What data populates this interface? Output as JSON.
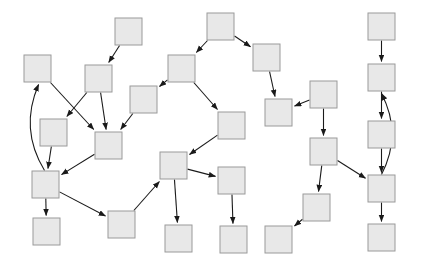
{
  "diagram": {
    "type": "directed-graph",
    "canvas": {
      "width": 424,
      "height": 265,
      "background": "#ffffff"
    },
    "style": {
      "node_fill": "#e8e8e8",
      "node_stroke": "#9a9a9a",
      "node_stroke_width": 1,
      "edge_color": "#1a1a1a",
      "edge_width": 1.1,
      "node_width": 27,
      "node_height": 27,
      "arrowhead": "filled-triangle"
    },
    "node_count": 27,
    "edge_count": 29,
    "nodes": [
      {
        "id": "n1",
        "label": "",
        "x": 24,
        "y": 55
      },
      {
        "id": "n2",
        "label": "",
        "x": 115,
        "y": 18
      },
      {
        "id": "n3",
        "label": "",
        "x": 207,
        "y": 13
      },
      {
        "id": "n4",
        "label": "",
        "x": 253,
        "y": 44
      },
      {
        "id": "n5",
        "label": "",
        "x": 368,
        "y": 13
      },
      {
        "id": "n6",
        "label": "",
        "x": 85,
        "y": 65
      },
      {
        "id": "n7",
        "label": "",
        "x": 168,
        "y": 55
      },
      {
        "id": "n8",
        "label": "",
        "x": 368,
        "y": 64
      },
      {
        "id": "n9",
        "label": "",
        "x": 130,
        "y": 86
      },
      {
        "id": "n10",
        "label": "",
        "x": 310,
        "y": 81
      },
      {
        "id": "n11",
        "label": "",
        "x": 265,
        "y": 99
      },
      {
        "id": "n12",
        "label": "",
        "x": 40,
        "y": 119
      },
      {
        "id": "n13",
        "label": "",
        "x": 95,
        "y": 132
      },
      {
        "id": "n14",
        "label": "",
        "x": 218,
        "y": 112
      },
      {
        "id": "n15",
        "label": "",
        "x": 368,
        "y": 121
      },
      {
        "id": "n16",
        "label": "",
        "x": 310,
        "y": 138
      },
      {
        "id": "n17",
        "label": "",
        "x": 160,
        "y": 152
      },
      {
        "id": "n18",
        "label": "",
        "x": 32,
        "y": 171
      },
      {
        "id": "n19",
        "label": "",
        "x": 218,
        "y": 167
      },
      {
        "id": "n20",
        "label": "",
        "x": 368,
        "y": 175
      },
      {
        "id": "n21",
        "label": "",
        "x": 303,
        "y": 194
      },
      {
        "id": "n22",
        "label": "",
        "x": 108,
        "y": 211
      },
      {
        "id": "n23",
        "label": "",
        "x": 33,
        "y": 218
      },
      {
        "id": "n24",
        "label": "",
        "x": 165,
        "y": 225
      },
      {
        "id": "n25",
        "label": "",
        "x": 220,
        "y": 226
      },
      {
        "id": "n26",
        "label": "",
        "x": 265,
        "y": 226
      },
      {
        "id": "n27",
        "label": "",
        "x": 368,
        "y": 224
      }
    ],
    "edges": [
      {
        "id": "e1",
        "from": "n1",
        "to": "n13",
        "kind": "straight"
      },
      {
        "id": "e2",
        "from": "n2",
        "to": "n6",
        "kind": "straight"
      },
      {
        "id": "e3",
        "from": "n3",
        "to": "n4",
        "kind": "straight"
      },
      {
        "id": "e4",
        "from": "n3",
        "to": "n7",
        "kind": "straight"
      },
      {
        "id": "e5",
        "from": "n5",
        "to": "n8",
        "kind": "straight"
      },
      {
        "id": "e6",
        "from": "n6",
        "to": "n12",
        "kind": "straight"
      },
      {
        "id": "e7",
        "from": "n6",
        "to": "n13",
        "kind": "straight"
      },
      {
        "id": "e8",
        "from": "n7",
        "to": "n9",
        "kind": "straight"
      },
      {
        "id": "e9",
        "from": "n7",
        "to": "n14",
        "kind": "straight"
      },
      {
        "id": "e10",
        "from": "n9",
        "to": "n13",
        "kind": "straight"
      },
      {
        "id": "e11",
        "from": "n4",
        "to": "n11",
        "kind": "straight"
      },
      {
        "id": "e12",
        "from": "n10",
        "to": "n11",
        "kind": "straight"
      },
      {
        "id": "e13",
        "from": "n10",
        "to": "n16",
        "kind": "straight"
      },
      {
        "id": "e14",
        "from": "n8",
        "to": "n15",
        "kind": "straight"
      },
      {
        "id": "e15",
        "from": "n12",
        "to": "n18",
        "kind": "straight"
      },
      {
        "id": "e16",
        "from": "n13",
        "to": "n18",
        "kind": "straight"
      },
      {
        "id": "e17",
        "from": "n14",
        "to": "n17",
        "kind": "straight"
      },
      {
        "id": "e18",
        "from": "n17",
        "to": "n19",
        "kind": "straight"
      },
      {
        "id": "e19",
        "from": "n17",
        "to": "n24",
        "kind": "straight"
      },
      {
        "id": "e20",
        "from": "n19",
        "to": "n25",
        "kind": "straight"
      },
      {
        "id": "e21",
        "from": "n16",
        "to": "n21",
        "kind": "straight"
      },
      {
        "id": "e22",
        "from": "n16",
        "to": "n20",
        "kind": "straight"
      },
      {
        "id": "e23",
        "from": "n21",
        "to": "n26",
        "kind": "straight"
      },
      {
        "id": "e24",
        "from": "n15",
        "to": "n20",
        "kind": "straight"
      },
      {
        "id": "e25",
        "from": "n20",
        "to": "n27",
        "kind": "straight"
      },
      {
        "id": "e26",
        "from": "n20",
        "to": "n8",
        "kind": "curved"
      },
      {
        "id": "e27",
        "from": "n18",
        "to": "n1",
        "kind": "curved"
      },
      {
        "id": "e28",
        "from": "n18",
        "to": "n23",
        "kind": "straight"
      },
      {
        "id": "e29",
        "from": "n18",
        "to": "n22",
        "kind": "straight"
      },
      {
        "id": "e30",
        "from": "n22",
        "to": "n17",
        "kind": "straight"
      }
    ]
  }
}
